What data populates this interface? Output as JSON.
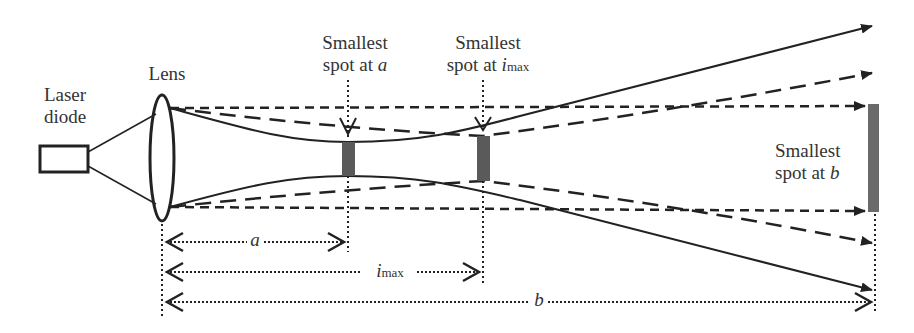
{
  "diagram": {
    "type": "optical-beam-focus",
    "components": {
      "laser_diode": {
        "label_line1": "Laser",
        "label_line2": "diode"
      },
      "lens": {
        "label": "Lens"
      }
    },
    "spots": {
      "a": {
        "line1": "Smallest",
        "line2_prefix": "spot at ",
        "var": "a"
      },
      "imax": {
        "line1": "Smallest",
        "line2_prefix": "spot at ",
        "var": "i",
        "sub": "max"
      },
      "b": {
        "line1": "Smallest",
        "line2_prefix": "spot at ",
        "var": "b"
      }
    },
    "dimensions": {
      "a": {
        "var": "a"
      },
      "imax": {
        "var": "i",
        "sub": "max"
      },
      "b": {
        "var": "b"
      }
    },
    "colors": {
      "line": "#222222",
      "spot": "#5a5a5a",
      "text": "#333333"
    }
  }
}
